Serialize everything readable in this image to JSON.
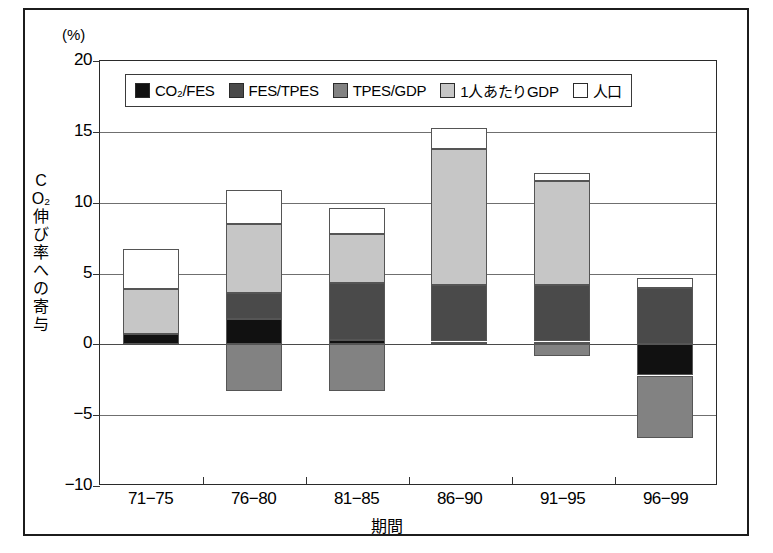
{
  "axis": {
    "unit_label": "(%)",
    "y_title_chars": [
      "C",
      "O₂",
      "伸",
      "び",
      "率",
      "へ",
      "の",
      "寄",
      "与"
    ],
    "y_ticks": [
      "20",
      "15",
      "10",
      "5",
      "0",
      "−5",
      "−10"
    ],
    "x_title": "期間",
    "x_ticks": [
      "71−75",
      "76−80",
      "81−85",
      "86−90",
      "91−95",
      "96−99"
    ]
  },
  "legend": {
    "items": [
      {
        "label": "CO₂/FES",
        "color": "#111111"
      },
      {
        "label": "FES/TPES",
        "color": "#4a4a4a"
      },
      {
        "label": "TPES/GDP",
        "color": "#828282"
      },
      {
        "label": "1人あたりGDP",
        "color": "#c6c6c6"
      },
      {
        "label": "人口",
        "color": "#ffffff"
      }
    ]
  },
  "chart_data": {
    "type": "bar",
    "stacked": true,
    "title": "",
    "xlabel": "期間",
    "ylabel": "CO₂伸び率への寄与",
    "unit": "%",
    "ylim": [
      -10,
      20
    ],
    "ytick_step": 5,
    "grid": true,
    "legend_position": "top-inside",
    "categories": [
      "71−75",
      "76−80",
      "81−85",
      "86−90",
      "91−95",
      "96−99"
    ],
    "series": [
      {
        "name": "CO₂/FES",
        "color": "#111111",
        "values": [
          0.7,
          1.8,
          0.3,
          0.2,
          0.2,
          -2.2
        ]
      },
      {
        "name": "FES/TPES",
        "color": "#4a4a4a",
        "values": [
          0.0,
          1.8,
          4.0,
          4.0,
          4.0,
          4.0
        ]
      },
      {
        "name": "TPES/GDP",
        "color": "#828282",
        "values": [
          0.0,
          -3.3,
          -3.3,
          0.0,
          -0.8,
          -4.4
        ]
      },
      {
        "name": "1人あたりGDP",
        "color": "#c6c6c6",
        "values": [
          3.2,
          4.9,
          3.5,
          9.6,
          7.3,
          0.0
        ]
      },
      {
        "name": "人口",
        "color": "#ffffff",
        "values": [
          2.8,
          2.4,
          1.8,
          1.5,
          0.6,
          0.65
        ]
      }
    ],
    "totals_positive": [
      6.7,
      11.9,
      9.6,
      15.3,
      12.1,
      4.0
    ],
    "totals_negative": [
      0.0,
      -3.3,
      -3.3,
      0.0,
      -0.8,
      -6.6
    ]
  }
}
